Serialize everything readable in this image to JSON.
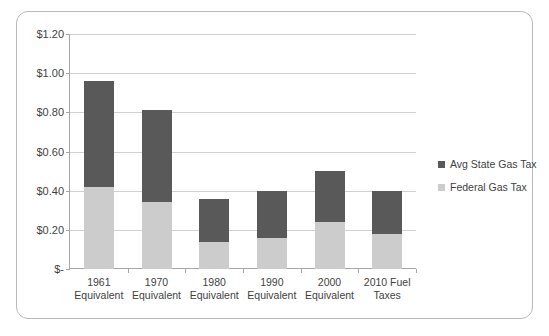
{
  "chart_data": {
    "type": "bar",
    "stacked": true,
    "title": "",
    "subtitle": "",
    "xlabel": "",
    "ylabel": "",
    "grid": true,
    "legend_position": "right",
    "ylim": [
      0,
      1.2
    ],
    "ytick_values": [
      1.2,
      1.0,
      0.8,
      0.6,
      0.4,
      0.2,
      0
    ],
    "ytick_labels": [
      "$1.20",
      "$1.00",
      "$0.80",
      "$0.60",
      "$0.40",
      "$0.20",
      "$-"
    ],
    "categories": [
      "1961 Equivalent",
      "1970 Equivalent",
      "1980 Equivalent",
      "1990 Equivalent",
      "2000 Equivalent",
      "2010 Fuel Taxes"
    ],
    "category_lines": [
      [
        "1961",
        "Equivalent"
      ],
      [
        "1970",
        "Equivalent"
      ],
      [
        "1980",
        "Equivalent"
      ],
      [
        "1990",
        "Equivalent"
      ],
      [
        "2000",
        "Equivalent"
      ],
      [
        "2010 Fuel",
        "Taxes"
      ]
    ],
    "series": [
      {
        "name": "Avg State Gas Tax",
        "color": "#595959",
        "values": [
          0.54,
          0.47,
          0.22,
          0.24,
          0.26,
          0.22
        ]
      },
      {
        "name": "Federal Gas Tax",
        "color": "#cccccc",
        "values": [
          0.42,
          0.34,
          0.14,
          0.16,
          0.24,
          0.18
        ]
      }
    ],
    "totals": [
      0.96,
      0.81,
      0.36,
      0.4,
      0.5,
      0.4
    ]
  },
  "legend": {
    "items": [
      {
        "label": "Avg State Gas Tax",
        "color": "#595959"
      },
      {
        "label": "Federal Gas Tax",
        "color": "#cccccc"
      }
    ]
  },
  "colors": {
    "state_series": "#595959",
    "federal_series": "#cccccc",
    "gridline": "#d0d0d0",
    "axis": "#a6a6a6",
    "frame_border": "#b9b9b9",
    "text": "#3f3f3f",
    "background": "#ffffff"
  }
}
